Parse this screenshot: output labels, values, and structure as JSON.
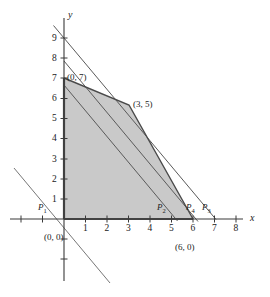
{
  "figure": {
    "kind": "linear-programming-feasible-region",
    "axes": {
      "x_label": "x",
      "y_label": "y",
      "x_ticks": [
        "1",
        "2",
        "3",
        "4",
        "5",
        "6",
        "7",
        "8"
      ],
      "y_ticks": [
        "1",
        "2",
        "3",
        "4",
        "5",
        "6",
        "7",
        "8",
        "9"
      ],
      "x_range": [
        -1.6,
        8.8
      ],
      "y_range": [
        -2.4,
        10.2
      ]
    },
    "region": {
      "fill_color": "#c9c9c9",
      "edge_color": "#4a4a4a",
      "vertices": [
        [
          0,
          0
        ],
        [
          0,
          7
        ],
        [
          3,
          5
        ],
        [
          6,
          0
        ]
      ]
    },
    "vertex_labels": [
      {
        "text": "(0, 7)",
        "at": [
          0,
          7
        ]
      },
      {
        "text": "(3, 5)",
        "at": [
          3,
          5
        ]
      },
      {
        "text": "(0, 0)",
        "at": [
          0,
          0
        ]
      },
      {
        "text": "(6, 0)",
        "at": [
          6,
          0
        ]
      }
    ],
    "objective_lines": [
      {
        "name": "P1",
        "label": "P",
        "sub": "1",
        "x_intercept": -0.55,
        "y_intercept": -0.72,
        "slope": -1.3
      },
      {
        "name": "P2",
        "label": "P",
        "sub": "2",
        "x_intercept": 5.1,
        "y_intercept": 6.63,
        "slope": -1.3
      },
      {
        "name": "P3",
        "label": "P",
        "sub": "3",
        "x_intercept": 7.2,
        "y_intercept": 9.36,
        "slope": -1.3
      },
      {
        "name": "P4",
        "label": "P",
        "sub": "4",
        "x_intercept": 6.0,
        "y_intercept": 7.8,
        "slope": -1.3
      }
    ],
    "line_color": "#555555"
  }
}
